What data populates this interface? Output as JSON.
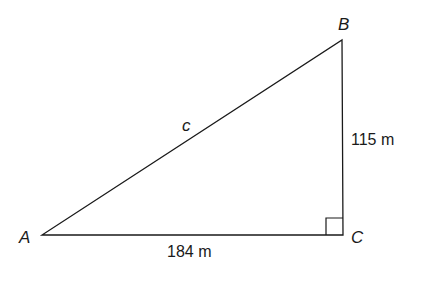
{
  "diagram": {
    "type": "right-triangle",
    "vertices": {
      "A": {
        "label": "A"
      },
      "B": {
        "label": "B"
      },
      "C": {
        "label": "C"
      }
    },
    "sides": {
      "hypotenuse": {
        "label": "c"
      },
      "vertical": {
        "label": "115 m"
      },
      "horizontal": {
        "label": "184 m"
      }
    },
    "right_angle_at": "C",
    "line_color": "#1a1a1a"
  }
}
